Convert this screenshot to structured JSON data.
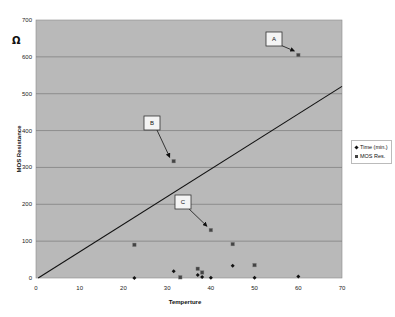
{
  "chart_data": {
    "type": "scatter",
    "title": "",
    "xlabel": "Temperture",
    "ylabel": "MOS Resistance",
    "ylabel_unit_symbol": "Ω",
    "xlim": [
      0,
      70
    ],
    "ylim": [
      0,
      700
    ],
    "x_ticks": [
      0,
      10,
      20,
      30,
      40,
      50,
      60,
      70
    ],
    "y_ticks": [
      0,
      100,
      200,
      300,
      400,
      500,
      600,
      700
    ],
    "grid": {
      "horizontal": true,
      "vertical": false
    },
    "plot_background": "#b9b9b9",
    "legend_position": "right",
    "series": [
      {
        "name": "Time (min.)",
        "marker": "diamond",
        "color": "#111111",
        "points": [
          [
            22.5,
            0
          ],
          [
            31.5,
            18
          ],
          [
            37,
            8
          ],
          [
            38,
            3
          ],
          [
            40,
            1
          ],
          [
            45,
            33
          ],
          [
            50,
            1
          ],
          [
            60,
            4
          ]
        ]
      },
      {
        "name": "MOS Res.",
        "marker": "square",
        "color": "#444444",
        "points": [
          [
            22.5,
            90
          ],
          [
            31.5,
            317
          ],
          [
            33,
            2
          ],
          [
            37,
            25
          ],
          [
            38,
            15
          ],
          [
            40,
            130
          ],
          [
            45,
            92
          ],
          [
            50,
            35
          ],
          [
            60,
            605
          ]
        ]
      }
    ],
    "trend_line": {
      "from": [
        0.5,
        0
      ],
      "to": [
        70,
        520
      ],
      "color": "#111111"
    },
    "annotations": [
      {
        "label": "A",
        "target": [
          60,
          605
        ]
      },
      {
        "label": "B",
        "target": [
          31.5,
          317
        ]
      },
      {
        "label": "C",
        "target": [
          40,
          130
        ]
      }
    ]
  }
}
